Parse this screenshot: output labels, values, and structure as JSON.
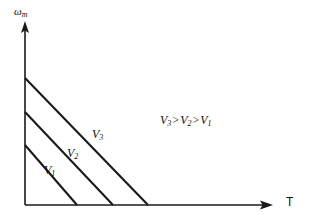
{
  "figure": {
    "background_color": "#ffffff",
    "stroke_color": "#1a1a1a",
    "width": 311,
    "height": 221
  },
  "axes": {
    "y_axis": {
      "name": "omega-m",
      "symbol": "ω",
      "subscript": "m",
      "arrow": "up-arrow-icon"
    },
    "x_axis": {
      "name": "T",
      "symbol": "T",
      "arrow": "right-arrow-icon"
    },
    "origin": {
      "x": 25,
      "y": 205
    },
    "x_axis_end": {
      "x": 272,
      "y": 205
    },
    "y_axis_end": {
      "x": 25,
      "y": 22
    }
  },
  "annotation": {
    "v3": "V",
    "v3_sub": "3",
    "gt1": ">",
    "v2": "V",
    "v2_sub": "2",
    "gt2": ">",
    "v1": "V",
    "v1_sub": "1",
    "full_text": "V3 > V2 > V1"
  },
  "curves": {
    "v3": {
      "label": "V",
      "sub": "3"
    },
    "v2": {
      "label": "V",
      "sub": "2"
    },
    "v1": {
      "label": "V",
      "sub": "1"
    }
  },
  "chart_data": {
    "type": "line",
    "title": "",
    "xlabel": "T",
    "ylabel": "ωm",
    "grid": false,
    "legend": "none",
    "axis_arrows": true,
    "annotations": [
      "V3 > V2 > V1"
    ],
    "series": [
      {
        "name": "V3",
        "label": "V3",
        "points_px": [
          [
            25,
            78
          ],
          [
            148,
            205
          ]
        ],
        "x": [
          0,
          1.0
        ],
        "y": [
          1.0,
          0.0
        ]
      },
      {
        "name": "V2",
        "label": "V2",
        "points_px": [
          [
            25,
            112
          ],
          [
            113,
            205
          ]
        ],
        "x": [
          0,
          0.715
        ],
        "y": [
          0.732,
          0.0
        ]
      },
      {
        "name": "V1",
        "label": "V1",
        "points_px": [
          [
            25,
            145
          ],
          [
            77,
            205
          ]
        ],
        "x": [
          0,
          0.425
        ],
        "y": [
          0.472,
          0.0
        ]
      }
    ],
    "xlim": [
      0,
      2.0
    ],
    "ylim": [
      0,
      1.44
    ]
  }
}
